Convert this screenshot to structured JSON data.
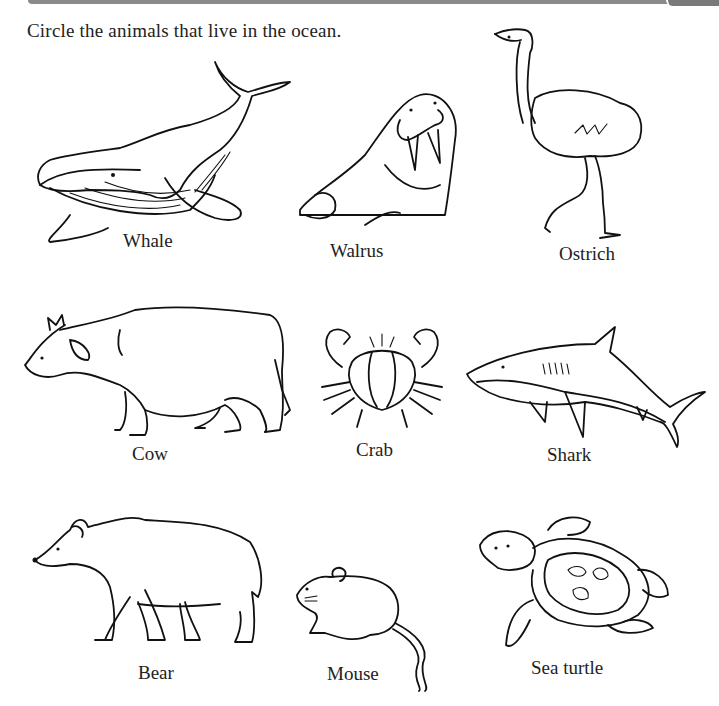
{
  "worksheet": {
    "instruction": "Circle the animals that live in the ocean.",
    "animals": [
      {
        "name": "Whale",
        "row": 1,
        "col": 1
      },
      {
        "name": "Walrus",
        "row": 1,
        "col": 2
      },
      {
        "name": "Ostrich",
        "row": 1,
        "col": 3
      },
      {
        "name": "Cow",
        "row": 2,
        "col": 1
      },
      {
        "name": "Crab",
        "row": 2,
        "col": 2
      },
      {
        "name": "Shark",
        "row": 2,
        "col": 3
      },
      {
        "name": "Bear",
        "row": 3,
        "col": 1
      },
      {
        "name": "Mouse",
        "row": 3,
        "col": 2
      },
      {
        "name": "Sea turtle",
        "row": 3,
        "col": 3
      }
    ]
  },
  "colors": {
    "line_art": "#111111",
    "text": "#222222",
    "header_bar": "#8a8a8a",
    "background": "#ffffff"
  }
}
